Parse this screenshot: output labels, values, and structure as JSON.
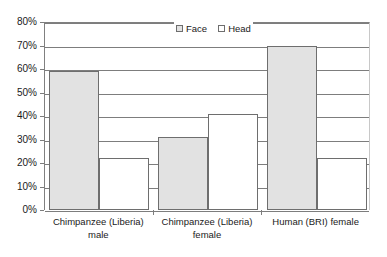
{
  "chart_data": {
    "type": "bar",
    "title": "",
    "subtitle": "",
    "xlabel": "",
    "ylabel": "",
    "categories": [
      "Chimpanzee (Liberia) male",
      "Chimpanzee (Liberia) female",
      "Human (BRI) female"
    ],
    "category_lines": [
      [
        "Chimpanzee (Liberia)",
        "male"
      ],
      [
        "Chimpanzee (Liberia)",
        "female"
      ],
      [
        "Human (BRI) female",
        ""
      ]
    ],
    "series": [
      {
        "name": "Face",
        "values": [
          59,
          31,
          70
        ],
        "color": "#e2e2e2"
      },
      {
        "name": "Head",
        "values": [
          22,
          41,
          22
        ],
        "color": "#ffffff"
      }
    ],
    "ylim": [
      0,
      80
    ],
    "ytick_values": [
      0,
      10,
      20,
      30,
      40,
      50,
      60,
      70,
      80
    ],
    "ytick_labels": [
      "0%",
      "10%",
      "20%",
      "30%",
      "40%",
      "50%",
      "60%",
      "70%",
      "80%"
    ],
    "grid": true,
    "legend_position": "top-center",
    "value_suffix": "%"
  },
  "legend": {
    "entries": [
      {
        "label": "Face"
      },
      {
        "label": "Head"
      }
    ]
  },
  "axis": {
    "y_labels": [
      "80%",
      "70%",
      "60%",
      "50%",
      "40%",
      "30%",
      "20%",
      "10%",
      "0%"
    ]
  }
}
